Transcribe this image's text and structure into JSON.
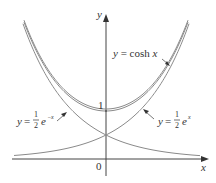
{
  "chart_data": {
    "type": "line",
    "title": "",
    "xlabel": "x",
    "ylabel": "y",
    "xlim": [
      -1.95,
      2.1
    ],
    "ylim": [
      -0.4,
      3.2
    ],
    "origin_label": "0",
    "y_tick_labels": [
      "1"
    ],
    "series": [
      {
        "name": "y = cosh x",
        "formula": "cosh(x)",
        "label": "y = cosh x"
      },
      {
        "name": "y = 1/2 e^-x",
        "formula": "0.5*exp(-x)",
        "label": "y = ½ e^−x"
      },
      {
        "name": "y = 1/2 e^x",
        "formula": "0.5*exp(x)",
        "label": "y = ½ e^x"
      }
    ],
    "key_points": [
      {
        "x": 0,
        "y": 1,
        "desc": "cosh minimum"
      },
      {
        "x": 0,
        "y": 0.5,
        "desc": "intersection of exponentials"
      }
    ],
    "grid": false,
    "legend": "inline annotations with arrows"
  },
  "labels": {
    "cosh": {
      "y": "y",
      "eq": " = cosh ",
      "x": "x"
    },
    "emx": {
      "y": "y",
      "eq": " = ",
      "num": "1",
      "den": "2",
      "e": "e",
      "exp": "−x"
    },
    "ex": {
      "y": "y",
      "eq": " = ",
      "num": "1",
      "den": "2",
      "e": "e",
      "exp": "x"
    },
    "tick_one": "1",
    "origin": "0",
    "x_axis": "x",
    "y_axis": "y"
  },
  "colors": {
    "curve": "#8a8a8a",
    "axis": "#444444",
    "text": "#333333"
  }
}
